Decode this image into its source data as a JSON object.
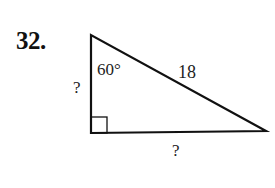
{
  "problem": {
    "number": "32.",
    "figure": {
      "type": "right-triangle",
      "angle_label": "60°",
      "hypotenuse_label": "18",
      "vertical_leg_label": "?",
      "horizontal_leg_label": "?",
      "right_angle_marker": true,
      "stroke_color": "#111111"
    }
  }
}
